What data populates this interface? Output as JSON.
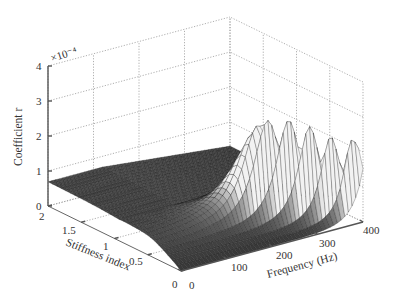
{
  "chart_data": {
    "type": "surface3d",
    "title": "",
    "xlabel": "Frequency (Hz)",
    "ylabel": "Stiffness index",
    "zlabel": "Coefficient r",
    "z_exponent_label": "×10⁻⁴",
    "x_ticks": [
      "0",
      "100",
      "200",
      "300",
      "400"
    ],
    "y_ticks": [
      "0",
      "0.5",
      "1",
      "1.5",
      "2"
    ],
    "z_ticks": [
      "0",
      "1",
      "2",
      "3",
      "4"
    ],
    "xlim": [
      0,
      400
    ],
    "ylim": [
      0,
      2
    ],
    "zlim": [
      0,
      4
    ],
    "z_scale": 0.0001,
    "grid": true,
    "legend": null,
    "surface_description": "Resonance-shaped surface: a sharp peak of coefficient r ≈ 2.9e-4 near frequency ≈ 230 Hz at low stiffness index (~0.3); broad low plateau (~0.7e-4) toward high stiffness and low frequency; surface rises again near 400 Hz at low stiffness.",
    "peak": {
      "frequency_hz": 230,
      "stiffness_index": 0.3,
      "r": 2.9
    },
    "plateau_r": 0.7
  },
  "colors": {
    "axis": "#555555",
    "grid": "#9a9a9a",
    "surface_dark": "#2e2e2e",
    "surface_light": "#f2f2f2",
    "mesh_line": "#111111"
  }
}
